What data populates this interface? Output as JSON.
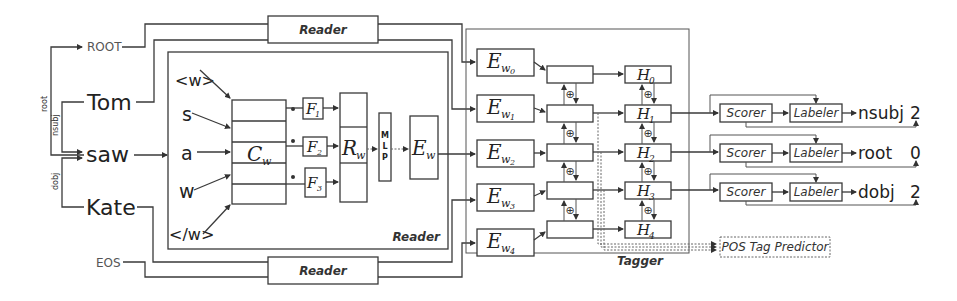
{
  "diagram": {
    "inputs": {
      "root_token": "ROOT",
      "eos_token": "EOS",
      "words": [
        "Tom",
        "saw",
        "Kate"
      ]
    },
    "arc_labels": {
      "root": "root",
      "nsubj": "nsubj",
      "dobj": "dobj"
    },
    "reader": {
      "label": "Reader",
      "chars": [
        "<w>",
        "s",
        "a",
        "w",
        "</w>"
      ],
      "char_matrix": "C",
      "char_matrix_sub": "w",
      "filters": [
        {
          "name": "F",
          "sub": "1"
        },
        {
          "name": "F",
          "sub": "2"
        },
        {
          "name": "F",
          "sub": "3"
        }
      ],
      "representation": "R",
      "representation_sub": "w",
      "mlp_letters": [
        "M",
        "L",
        "P"
      ],
      "embedding": "E",
      "embedding_sub": "w"
    },
    "top_reader_label": "Reader",
    "bottom_reader_label": "Reader",
    "tagger": {
      "label": "Tagger",
      "embeddings": [
        {
          "name": "E",
          "sub": "w",
          "subsub": "0"
        },
        {
          "name": "E",
          "sub": "w",
          "subsub": "1"
        },
        {
          "name": "E",
          "sub": "w",
          "subsub": "2"
        },
        {
          "name": "E",
          "sub": "w",
          "subsub": "3"
        },
        {
          "name": "E",
          "sub": "w",
          "subsub": "4"
        }
      ],
      "hidden": [
        {
          "name": "H",
          "sub": "0"
        },
        {
          "name": "H",
          "sub": "1"
        },
        {
          "name": "H",
          "sub": "2"
        },
        {
          "name": "H",
          "sub": "3"
        },
        {
          "name": "H",
          "sub": "4"
        }
      ],
      "concat_symbol": "⊕",
      "pos_predictor": "POS Tag Predictor"
    },
    "parser_rows": [
      {
        "scorer": "Scorer",
        "labeler": "Labeler",
        "label": "nsubj",
        "head": "2"
      },
      {
        "scorer": "Scorer",
        "labeler": "Labeler",
        "label": "root",
        "head": "0"
      },
      {
        "scorer": "Scorer",
        "labeler": "Labeler",
        "label": "dobj",
        "head": "2"
      }
    ]
  }
}
